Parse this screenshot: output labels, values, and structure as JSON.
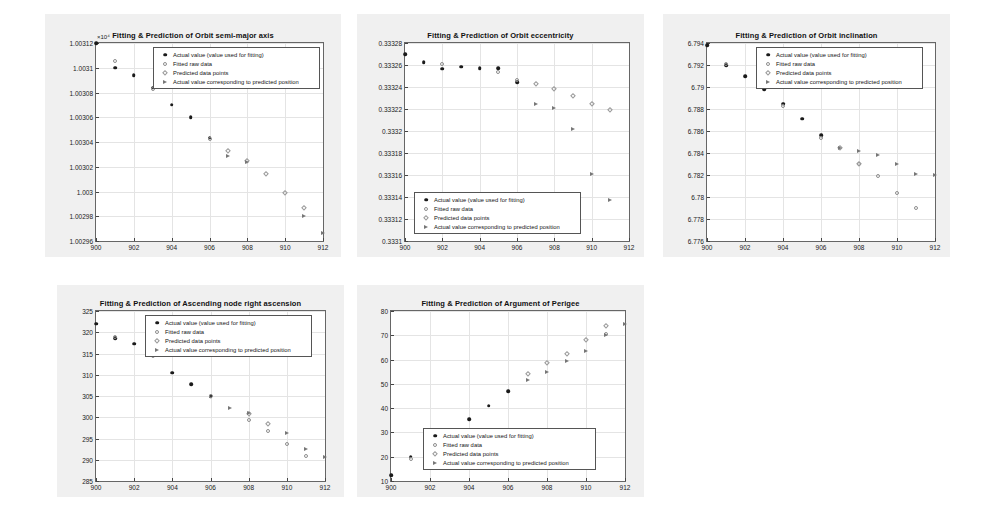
{
  "page": {
    "background": "#ffffff",
    "panel_background": "#f0f0f0",
    "plot_background": "#ffffff",
    "axis_color": "#666666",
    "grid_color": "#e4e4e4",
    "marker_actual_color": "#1a1a1a",
    "marker_fitted_color": "#8e8e8e",
    "marker_predicted_color": "#9a9a9a",
    "marker_actualpred_color": "#777777"
  },
  "legend": {
    "entries": [
      {
        "symbol": "filled-circle",
        "label": "Actual value (value used for fitting)"
      },
      {
        "symbol": "open-circle",
        "label": "Fitted raw data"
      },
      {
        "symbol": "open-diamond",
        "label": "Predicted data points"
      },
      {
        "symbol": "right-triangle",
        "label": "Actual value corresponding to predicted position"
      }
    ]
  },
  "chart_data": [
    {
      "id": "semi-major-axis",
      "type": "scatter",
      "title": "Fitting & Prediction of Orbit semi-major axis",
      "xlabel": "",
      "ylabel": "",
      "y_exponent": "×10⁴",
      "xlim": [
        900,
        912
      ],
      "ylim": [
        1.00296,
        1.00312
      ],
      "xticks": [
        900,
        902,
        904,
        906,
        908,
        910,
        912
      ],
      "yticks": [
        1.00296,
        1.00298,
        1.003,
        1.00302,
        1.00304,
        1.00306,
        1.00308,
        1.0031,
        1.00312
      ],
      "ytick_labels": [
        "1.00296",
        "1.00298",
        "1.003",
        "1.00302",
        "1.00304",
        "1.00306",
        "1.00308",
        "1.0031",
        "1.00312"
      ],
      "grid": true,
      "legend_position": "top-right",
      "series": [
        {
          "name": "Actual value (value used for fitting)",
          "marker": "filled-circle",
          "x": [
            900,
            901,
            902,
            903,
            904,
            905,
            906
          ],
          "y": [
            1.00312,
            1.0031,
            1.003094,
            1.003084,
            1.00307,
            1.00306,
            1.0030435
          ]
        },
        {
          "name": "Fitted raw data",
          "marker": "open-circle",
          "x": [
            901,
            903,
            906
          ],
          "y": [
            1.0031055,
            1.0030825,
            1.0030425
          ]
        },
        {
          "name": "Predicted data points",
          "marker": "open-diamond",
          "x": [
            907,
            908,
            909,
            910,
            911
          ],
          "y": [
            1.0030325,
            1.0030245,
            1.0030145,
            1.0029985,
            1.0029865
          ]
        },
        {
          "name": "Actual value corresponding to predicted position",
          "marker": "right-triangle",
          "x": [
            907,
            908,
            911,
            912
          ],
          "y": [
            1.003029,
            1.003024,
            1.0029805,
            1.0029665
          ]
        }
      ]
    },
    {
      "id": "eccentricity",
      "type": "scatter",
      "title": "Fitting & Prediction of Orbit eccentricity",
      "xlabel": "",
      "ylabel": "",
      "y_exponent": "",
      "xlim": [
        900,
        912
      ],
      "ylim": [
        0.3331,
        0.33328
      ],
      "xticks": [
        900,
        902,
        904,
        906,
        908,
        910,
        912
      ],
      "yticks": [
        0.3331,
        0.33312,
        0.33314,
        0.33316,
        0.33318,
        0.3332,
        0.33322,
        0.33324,
        0.33326,
        0.33328
      ],
      "ytick_labels": [
        "0.3331",
        "0.33312",
        "0.33314",
        "0.33316",
        "0.33318",
        "0.3332",
        "0.33322",
        "0.33324",
        "0.33326",
        "0.33328"
      ],
      "grid": true,
      "legend_position": "bottom-left",
      "series": [
        {
          "name": "Actual value (value used for fitting)",
          "marker": "filled-circle",
          "x": [
            900,
            901,
            902,
            903,
            904,
            905,
            906
          ],
          "y": [
            0.33327,
            0.3332625,
            0.3332565,
            0.3332585,
            0.333257,
            0.333257,
            0.3332445
          ]
        },
        {
          "name": "Fitted raw data",
          "marker": "open-circle",
          "x": [
            902,
            905,
            906
          ],
          "y": [
            0.3332605,
            0.3332535,
            0.3332465
          ]
        },
        {
          "name": "Predicted data points",
          "marker": "open-diamond",
          "x": [
            907,
            908,
            909,
            910,
            911
          ],
          "y": [
            0.3332425,
            0.3332385,
            0.3332315,
            0.3332245,
            0.3332195
          ]
        },
        {
          "name": "Actual value corresponding to predicted position",
          "marker": "right-triangle",
          "x": [
            907,
            908,
            909,
            910,
            911
          ],
          "y": [
            0.333225,
            0.333221,
            0.333202,
            0.333161,
            0.333137
          ]
        }
      ]
    },
    {
      "id": "inclination",
      "type": "scatter",
      "title": "Fitting & Prediction of Orbit inclination",
      "xlabel": "",
      "ylabel": "",
      "y_exponent": "",
      "xlim": [
        900,
        912
      ],
      "ylim": [
        6.776,
        6.794
      ],
      "xticks": [
        900,
        902,
        904,
        906,
        908,
        910,
        912
      ],
      "yticks": [
        6.776,
        6.778,
        6.78,
        6.782,
        6.784,
        6.786,
        6.788,
        6.79,
        6.792,
        6.794
      ],
      "ytick_labels": [
        "6.776",
        "6.778",
        "6.78",
        "6.782",
        "6.784",
        "6.786",
        "6.788",
        "6.79",
        "6.792",
        "6.794"
      ],
      "grid": true,
      "legend_position": "top-right",
      "series": [
        {
          "name": "Actual value (value used for fitting)",
          "marker": "filled-circle",
          "x": [
            900,
            901,
            902,
            903,
            904,
            905,
            906
          ],
          "y": [
            6.7938,
            6.792,
            6.791,
            6.7898,
            6.7885,
            6.7871,
            6.7856
          ]
        },
        {
          "name": "Fitted raw data",
          "marker": "open-circle",
          "x": [
            901,
            904,
            906,
            908,
            909,
            910,
            911
          ],
          "y": [
            6.7921,
            6.7883,
            6.7854,
            6.783,
            6.7819,
            6.7804,
            6.779
          ]
        },
        {
          "name": "Predicted data points",
          "marker": "open-diamond",
          "x": [
            907,
            908
          ],
          "y": [
            6.7845,
            6.783
          ]
        },
        {
          "name": "Actual value corresponding to predicted position",
          "marker": "right-triangle",
          "x": [
            907,
            908,
            909,
            910,
            911,
            912
          ],
          "y": [
            6.7845,
            6.7842,
            6.7838,
            6.783,
            6.7821,
            6.782
          ]
        }
      ]
    },
    {
      "id": "ascending-node-right-ascension",
      "type": "scatter",
      "title": "Fitting & Prediction of Ascending node right ascension",
      "xlabel": "",
      "ylabel": "",
      "y_exponent": "",
      "xlim": [
        900,
        912
      ],
      "ylim": [
        285,
        325
      ],
      "xticks": [
        900,
        902,
        904,
        906,
        908,
        910,
        912
      ],
      "yticks": [
        285,
        290,
        295,
        300,
        305,
        310,
        315,
        320,
        325
      ],
      "ytick_labels": [
        "285",
        "290",
        "295",
        "300",
        "305",
        "310",
        "315",
        "320",
        "325"
      ],
      "grid": true,
      "legend_position": "top-right",
      "series": [
        {
          "name": "Actual value (value used for fitting)",
          "marker": "filled-circle",
          "x": [
            900,
            901,
            902,
            903,
            904,
            905,
            906
          ],
          "y": [
            322.0,
            318.6,
            317.3,
            314.8,
            310.5,
            307.8,
            304.9
          ]
        },
        {
          "name": "Fitted raw data",
          "marker": "open-circle",
          "x": [
            901,
            903,
            906,
            908,
            909,
            910,
            911
          ],
          "y": [
            318.8,
            314.4,
            304.9,
            299.4,
            296.7,
            293.6,
            291.0
          ]
        },
        {
          "name": "Predicted data points",
          "marker": "open-diamond",
          "x": [
            908,
            909
          ],
          "y": [
            300.7,
            298.5
          ]
        },
        {
          "name": "Actual value corresponding to predicted position",
          "marker": "right-triangle",
          "x": [
            907,
            908,
            910,
            911,
            912
          ],
          "y": [
            302.2,
            301.1,
            296.2,
            292.6,
            290.7
          ]
        }
      ]
    },
    {
      "id": "argument-of-perigee",
      "type": "scatter",
      "title": "Fitting & Prediction of Argument of Perigee",
      "xlabel": "",
      "ylabel": "",
      "y_exponent": "",
      "xlim": [
        900,
        912
      ],
      "ylim": [
        10,
        80
      ],
      "xticks": [
        900,
        902,
        904,
        906,
        908,
        910,
        912
      ],
      "yticks": [
        10,
        20,
        30,
        40,
        50,
        60,
        70,
        80
      ],
      "ytick_labels": [
        "10",
        "20",
        "30",
        "40",
        "50",
        "60",
        "70",
        "80"
      ],
      "grid": true,
      "legend_position": "bottom-center",
      "series": [
        {
          "name": "Actual value (value used for fitting)",
          "marker": "filled-circle",
          "x": [
            900,
            901,
            902,
            903,
            904,
            905,
            906
          ],
          "y": [
            12.5,
            20.0,
            24.0,
            28.8,
            35.5,
            41.0,
            47.0
          ]
        },
        {
          "name": "Fitted raw data",
          "marker": "open-circle",
          "x": [
            901,
            903,
            911
          ],
          "y": [
            19.0,
            29.5,
            70.5
          ]
        },
        {
          "name": "Predicted data points",
          "marker": "open-diamond",
          "x": [
            907,
            908,
            909,
            910,
            911
          ],
          "y": [
            54.0,
            58.5,
            62.5,
            68.0,
            74.0
          ]
        },
        {
          "name": "Actual value corresponding to predicted position",
          "marker": "right-triangle",
          "x": [
            907,
            908,
            909,
            910,
            911,
            912
          ],
          "y": [
            51.5,
            55.0,
            59.5,
            63.5,
            70.0,
            74.5
          ]
        }
      ]
    }
  ],
  "figures": [
    {
      "id": "semi-major-axis",
      "left": 45,
      "top": 14,
      "width": 296,
      "height": 243,
      "plot": {
        "left": 50,
        "top": 28,
        "width": 229,
        "height": 200
      },
      "legend": {
        "left": 108,
        "top": 33,
        "width": 167,
        "height": 42
      }
    },
    {
      "id": "eccentricity",
      "left": 357,
      "top": 14,
      "width": 287,
      "height": 243,
      "plot": {
        "left": 47,
        "top": 28,
        "width": 226,
        "height": 200
      },
      "legend": {
        "left": 57,
        "top": 178,
        "width": 167,
        "height": 42
      }
    },
    {
      "id": "inclination",
      "left": 663,
      "top": 14,
      "width": 287,
      "height": 243,
      "plot": {
        "left": 43,
        "top": 28,
        "width": 230,
        "height": 200
      },
      "legend": {
        "left": 93,
        "top": 33,
        "width": 167,
        "height": 42
      }
    },
    {
      "id": "ascending-node-right-ascension",
      "left": 57,
      "top": 285,
      "width": 287,
      "height": 212,
      "plot": {
        "left": 38,
        "top": 25,
        "width": 231,
        "height": 172
      },
      "legend": {
        "left": 88,
        "top": 30,
        "width": 167,
        "height": 42
      }
    },
    {
      "id": "argument-of-perigee",
      "left": 357,
      "top": 285,
      "width": 287,
      "height": 212,
      "plot": {
        "left": 33,
        "top": 25,
        "width": 236,
        "height": 172
      },
      "legend": {
        "left": 66,
        "top": 143,
        "width": 173,
        "height": 42
      }
    }
  ]
}
